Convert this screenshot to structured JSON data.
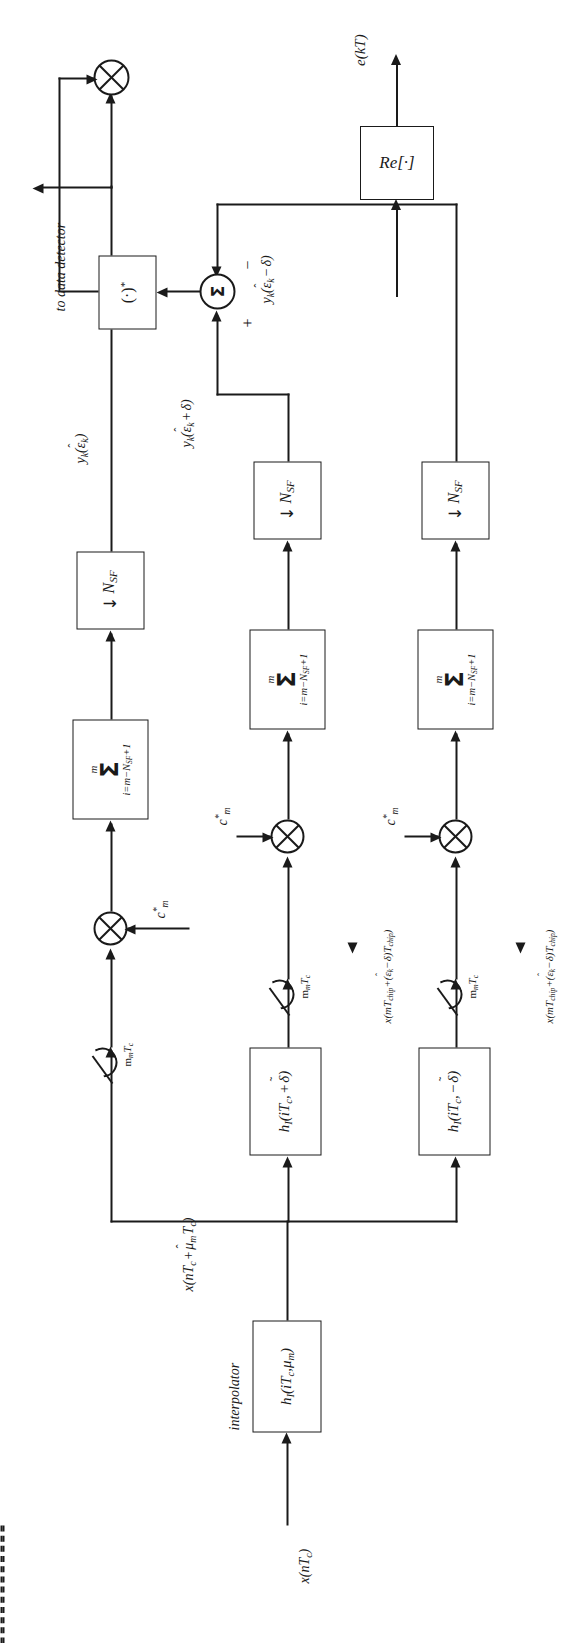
{
  "figure": {
    "orientation": "rotated-90-ccw",
    "line_color": "#1a1a1a",
    "background": "#ffffff"
  },
  "inputs": {
    "source_signal": "x(nTc)",
    "source_signal_parts": {
      "base": "x(n",
      "t": "T",
      "tsub": "c",
      "close": ")"
    }
  },
  "blocks": {
    "interpolator": {
      "caption": "interpolator",
      "label": "hI(iTc, μm)",
      "f": "h",
      "fsub": "I",
      "arg1": "T",
      "arg1sub": "c",
      "arg2": "μ",
      "arg2sub": "m"
    },
    "filter_early": {
      "label": "hI(iTc, + δ̃)",
      "sign": "+"
    },
    "filter_late": {
      "label": "hI(iTc, − δ̃)",
      "sign": "−"
    },
    "sum_block": {
      "upper": "m",
      "sigma": "Σ",
      "lower": "i=m−NSF+1"
    },
    "decimator": {
      "arrow": "↓",
      "label": "NSF",
      "n": "N",
      "nsub": "SF"
    },
    "conjugate": {
      "label": "(·)*"
    },
    "real_part": {
      "label": "Re[·]"
    }
  },
  "operators": {
    "multiplier": "⊗",
    "summing_junction": "Σ",
    "plus_sign": "+",
    "minus_sign": "−"
  },
  "signals": {
    "despread_code": "c*m",
    "interp_out": "x(nTc + μ̂m Tc)",
    "sampler_rate": "mm Tc",
    "timing_mid": "x(mTchip+(ε̂k−δ)Tchip)",
    "timing_low": "x(mTchip+(ε̂k−δ)Tchip)",
    "y_on_time": "yk(ε̂k)",
    "y_early": "yk(ε̂k + δ)",
    "y_late": "yk(ε̂k − δ)",
    "to_detector": "to data detector",
    "error_out": "e(kT)"
  },
  "symbols": {
    "x": "x",
    "y": "y",
    "c": "c",
    "h": "h",
    "e": "e",
    "T": "T",
    "N": "N",
    "m": "m",
    "n": "n",
    "i": "i",
    "k": "k",
    "mu": "μ",
    "delta": "δ",
    "epsilon": "ε",
    "sub_c": "c",
    "sub_I": "I",
    "sub_SF": "SF",
    "sub_chip": "chip",
    "sub_m": "m",
    "sub_k": "k",
    "hat": "ˆ",
    "tilde": "˜",
    "star": "*",
    "down_arrow": "↓"
  }
}
